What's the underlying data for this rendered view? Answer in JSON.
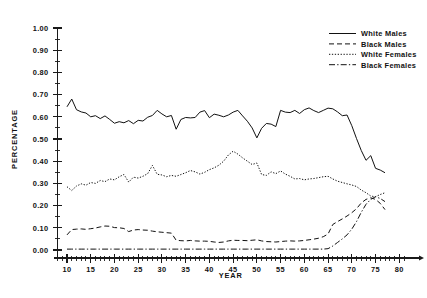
{
  "chart_data": {
    "type": "line",
    "title": "",
    "xlabel": "YEAR",
    "ylabel": "PERCENTAGE",
    "xlim": [
      8,
      81
    ],
    "ylim": [
      0.0,
      1.0
    ],
    "grid": false,
    "legend_position": "top-right",
    "x_ticks": [
      10,
      15,
      20,
      25,
      30,
      35,
      40,
      45,
      50,
      55,
      60,
      65,
      70,
      75,
      80
    ],
    "x_tick_labels": [
      "10",
      "15",
      "20",
      "25",
      "30",
      "35",
      "40",
      "45",
      "50",
      "55",
      "60",
      "65",
      "70",
      "75",
      "80"
    ],
    "x_minor_step": 1,
    "y_ticks": [
      0.0,
      0.1,
      0.2,
      0.3,
      0.4,
      0.5,
      0.6,
      0.7,
      0.8,
      0.9,
      1.0
    ],
    "y_tick_labels": [
      "0.00",
      "0.10",
      "0.20",
      "0.30",
      "0.40",
      "0.50",
      "0.60",
      "0.70",
      "0.80",
      "0.90",
      "1.00"
    ],
    "y_minor_step": 0.05,
    "x": [
      10,
      11,
      12,
      13,
      14,
      15,
      16,
      17,
      18,
      19,
      20,
      21,
      22,
      23,
      24,
      25,
      26,
      27,
      28,
      29,
      30,
      31,
      32,
      33,
      34,
      35,
      36,
      37,
      38,
      39,
      40,
      41,
      42,
      43,
      44,
      45,
      46,
      47,
      48,
      49,
      50,
      51,
      52,
      53,
      54,
      55,
      56,
      57,
      58,
      59,
      60,
      61,
      62,
      63,
      64,
      65,
      66,
      67,
      68,
      69,
      70,
      71,
      72,
      73,
      74,
      75,
      76,
      77
    ],
    "series": [
      {
        "name": "White Males",
        "style": "solid",
        "color": "#111111",
        "values": [
          0.645,
          0.68,
          0.632,
          0.622,
          0.617,
          0.6,
          0.605,
          0.592,
          0.604,
          0.588,
          0.571,
          0.578,
          0.573,
          0.583,
          0.569,
          0.584,
          0.581,
          0.598,
          0.606,
          0.629,
          0.613,
          0.6,
          0.606,
          0.544,
          0.588,
          0.597,
          0.595,
          0.597,
          0.621,
          0.628,
          0.596,
          0.612,
          0.607,
          0.6,
          0.608,
          0.621,
          0.629,
          0.604,
          0.58,
          0.55,
          0.505,
          0.548,
          0.57,
          0.567,
          0.556,
          0.629,
          0.621,
          0.619,
          0.629,
          0.615,
          0.632,
          0.64,
          0.628,
          0.619,
          0.629,
          0.639,
          0.636,
          0.622,
          0.605,
          0.608,
          0.56,
          0.502,
          0.448,
          0.404,
          0.425,
          0.368,
          0.36,
          0.348
        ],
        "endpoint": 0.348
      },
      {
        "name": "Black Males",
        "style": "dashed",
        "color": "#111111",
        "values": [
          0.068,
          0.092,
          0.094,
          0.095,
          0.093,
          0.096,
          0.099,
          0.104,
          0.108,
          0.107,
          0.101,
          0.1,
          0.097,
          0.083,
          0.09,
          0.092,
          0.09,
          0.089,
          0.085,
          0.082,
          0.08,
          0.078,
          0.076,
          0.044,
          0.042,
          0.041,
          0.043,
          0.041,
          0.04,
          0.04,
          0.039,
          0.036,
          0.034,
          0.036,
          0.041,
          0.044,
          0.043,
          0.043,
          0.042,
          0.044,
          0.046,
          0.041,
          0.038,
          0.037,
          0.036,
          0.038,
          0.04,
          0.041,
          0.04,
          0.041,
          0.043,
          0.046,
          0.049,
          0.053,
          0.06,
          0.072,
          0.115,
          0.128,
          0.14,
          0.153,
          0.168,
          0.186,
          0.212,
          0.228,
          0.235,
          0.228,
          0.21,
          0.182
        ],
        "endpoint": 0.182
      },
      {
        "name": "White Females",
        "style": "dotted",
        "color": "#111111",
        "values": [
          0.285,
          0.268,
          0.288,
          0.298,
          0.292,
          0.304,
          0.3,
          0.313,
          0.308,
          0.32,
          0.316,
          0.33,
          0.34,
          0.306,
          0.328,
          0.324,
          0.332,
          0.344,
          0.381,
          0.341,
          0.338,
          0.33,
          0.336,
          0.332,
          0.34,
          0.348,
          0.358,
          0.352,
          0.342,
          0.35,
          0.362,
          0.37,
          0.382,
          0.4,
          0.428,
          0.445,
          0.432,
          0.415,
          0.4,
          0.385,
          0.392,
          0.34,
          0.336,
          0.352,
          0.344,
          0.356,
          0.342,
          0.332,
          0.32,
          0.322,
          0.316,
          0.32,
          0.322,
          0.326,
          0.33,
          0.332,
          0.32,
          0.31,
          0.304,
          0.298,
          0.293,
          0.286,
          0.27,
          0.258,
          0.243,
          0.24,
          0.25,
          0.258
        ],
        "endpoint": 0.258
      },
      {
        "name": "Black Females",
        "style": "dashdot",
        "color": "#111111",
        "values": [
          0.004,
          0.004,
          0.004,
          0.004,
          0.004,
          0.004,
          0.004,
          0.004,
          0.004,
          0.004,
          0.004,
          0.004,
          0.004,
          0.004,
          0.004,
          0.004,
          0.004,
          0.004,
          0.004,
          0.004,
          0.004,
          0.004,
          0.004,
          0.004,
          0.004,
          0.004,
          0.004,
          0.004,
          0.004,
          0.004,
          0.004,
          0.004,
          0.004,
          0.004,
          0.004,
          0.004,
          0.004,
          0.004,
          0.004,
          0.004,
          0.004,
          0.004,
          0.004,
          0.004,
          0.004,
          0.004,
          0.004,
          0.004,
          0.004,
          0.004,
          0.004,
          0.004,
          0.004,
          0.004,
          0.004,
          0.006,
          0.018,
          0.034,
          0.05,
          0.068,
          0.094,
          0.128,
          0.17,
          0.206,
          0.228,
          0.24,
          0.232,
          0.218
        ],
        "endpoint": 0.218
      }
    ]
  },
  "legend": {
    "entries": [
      {
        "label": "White Males",
        "style": "solid"
      },
      {
        "label": "Black Males",
        "style": "dashed"
      },
      {
        "label": "White Females",
        "style": "dotted"
      },
      {
        "label": "Black Females",
        "style": "dashdot"
      }
    ]
  }
}
